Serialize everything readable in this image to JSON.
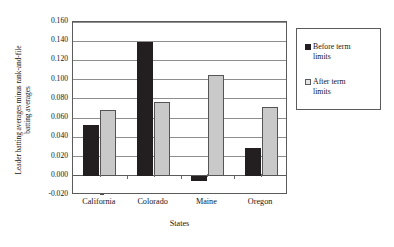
{
  "chart_data": {
    "type": "bar",
    "title": "",
    "categories": [
      "California",
      "Colorado",
      "Maine",
      "Oregon"
    ],
    "series": [
      {
        "name": "Before term limits",
        "values": [
          0.053,
          0.139,
          -0.005,
          0.029
        ],
        "color": "#231f20"
      },
      {
        "name": "After term limits",
        "values": [
          0.068,
          0.077,
          0.105,
          0.072
        ],
        "color": "#c9c9c9"
      }
    ],
    "xlabel": "States",
    "ylabel_line1": "Leader batting averages minus rank-and-file",
    "ylabel_line2": "batting averages",
    "ylim": [
      -0.02,
      0.16
    ],
    "ytick_values": [
      0.16,
      0.14,
      0.12,
      0.1,
      0.08,
      0.06,
      0.04,
      0.02,
      0.0,
      -0.02
    ],
    "ytick_labels": [
      "0.160",
      "0.140",
      "0.120",
      "0.100",
      "0.080",
      "0.060",
      "0.040",
      "0.020",
      "0.000",
      "-0.020"
    ],
    "grid": true,
    "grid_axis": "y",
    "legend_position": "right-outside",
    "legend_entries": [
      "Before term limits",
      "After term limits"
    ]
  }
}
